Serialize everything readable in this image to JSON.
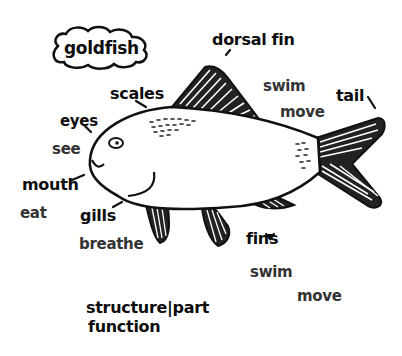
{
  "title": "goldfish",
  "legend": {
    "line1": "structure|part",
    "line2": "function"
  },
  "labels": {
    "dorsal_fin": "dorsal fin",
    "dorsal_fin_func1": "swim",
    "dorsal_fin_func2": "move",
    "tail": "tail",
    "scales": "scales",
    "eyes": "eyes",
    "eyes_func": "see",
    "mouth": "mouth",
    "mouth_func": "eat",
    "gills": "gills",
    "gills_func": "breathe",
    "fins": "fins",
    "fins_func1": "swim",
    "fins_func2": "move"
  },
  "colors": {
    "ink": "#111111",
    "paper": "#ffffff",
    "function_ink": "#333333"
  }
}
